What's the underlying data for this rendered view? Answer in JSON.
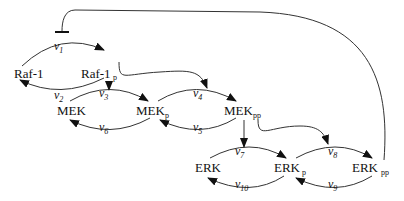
{
  "diagram": {
    "nodes": [
      {
        "id": "raf1",
        "label": "Raf-1",
        "sub": ""
      },
      {
        "id": "raf1p",
        "label": "Raf-1",
        "sub": "p"
      },
      {
        "id": "mek",
        "label": "MEK",
        "sub": ""
      },
      {
        "id": "mekp",
        "label": "MEK",
        "sub": "p"
      },
      {
        "id": "mekpp",
        "label": "MEK",
        "sub": "pp"
      },
      {
        "id": "erk",
        "label": "ERK",
        "sub": ""
      },
      {
        "id": "erkp",
        "label": "ERK",
        "sub": "p"
      },
      {
        "id": "erkpp",
        "label": "ERK",
        "sub": "pp"
      }
    ],
    "rates": [
      {
        "id": "v1",
        "symbol": "v",
        "sub": "1",
        "from": "raf1",
        "to": "raf1p"
      },
      {
        "id": "v2",
        "symbol": "v",
        "sub": "2",
        "from": "raf1p",
        "to": "raf1"
      },
      {
        "id": "v3",
        "symbol": "v",
        "sub": "3",
        "from": "mek",
        "to": "mekp"
      },
      {
        "id": "v6",
        "symbol": "v",
        "sub": "6",
        "from": "mekp",
        "to": "mek"
      },
      {
        "id": "v4",
        "symbol": "v",
        "sub": "4",
        "from": "mekp",
        "to": "mekpp"
      },
      {
        "id": "v5",
        "symbol": "v",
        "sub": "5",
        "from": "mekpp",
        "to": "mekp"
      },
      {
        "id": "v7",
        "symbol": "v",
        "sub": "7",
        "from": "erk",
        "to": "erkp"
      },
      {
        "id": "v10",
        "symbol": "v",
        "sub": "10",
        "from": "erkp",
        "to": "erk"
      },
      {
        "id": "v8",
        "symbol": "v",
        "sub": "8",
        "from": "erkp",
        "to": "erkpp"
      },
      {
        "id": "v9",
        "symbol": "v",
        "sub": "9",
        "from": "erkpp",
        "to": "erkp"
      }
    ],
    "catalysis": [
      {
        "from": "raf1p",
        "target": "v3"
      },
      {
        "from": "raf1p",
        "target": "v4"
      },
      {
        "from": "mekpp",
        "target": "v7"
      },
      {
        "from": "mekpp",
        "target": "v8"
      }
    ],
    "inhibition": [
      {
        "from": "erkpp",
        "target": "v1"
      }
    ],
    "colors": {
      "stroke": "#333333",
      "text": "#111111",
      "background": "#ffffff"
    }
  }
}
